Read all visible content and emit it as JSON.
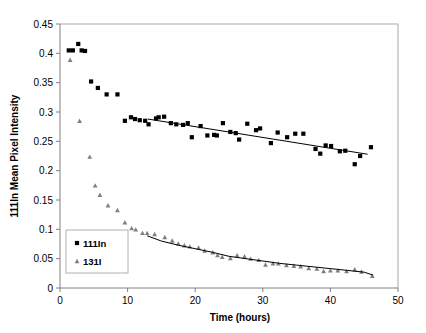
{
  "chart_data": {
    "type": "scatter",
    "title": "",
    "xlabel": "Time (hours)",
    "ylabel": "111In Mean Pixel Intensity",
    "xlim": [
      0,
      50
    ],
    "ylim": [
      0,
      0.45
    ],
    "xticks": [
      0,
      10,
      20,
      30,
      40,
      50
    ],
    "xtick_labels": [
      "0",
      "10",
      "20",
      "30",
      "40",
      "50"
    ],
    "yticks": [
      0,
      0.05,
      0.1,
      0.15,
      0.2,
      0.25,
      0.3,
      0.35,
      0.4,
      0.45
    ],
    "ytick_labels": [
      "0",
      "0.05",
      "0.1",
      "0.15",
      "0.2",
      "0.25",
      "0.3",
      "0.35",
      "0.4",
      "0.45"
    ],
    "grid": false,
    "legend_position": "lower-left-inside",
    "series": [
      {
        "name": "111In",
        "marker": "square",
        "color": "#000000",
        "points": [
          [
            1.3,
            0.405
          ],
          [
            1.9,
            0.405
          ],
          [
            2.7,
            0.416
          ],
          [
            3.2,
            0.405
          ],
          [
            3.7,
            0.404
          ],
          [
            4.6,
            0.352
          ],
          [
            5.6,
            0.341
          ],
          [
            6.9,
            0.33
          ],
          [
            8.5,
            0.33
          ],
          [
            9.6,
            0.285
          ],
          [
            10.5,
            0.291
          ],
          [
            11.1,
            0.288
          ],
          [
            11.8,
            0.286
          ],
          [
            12.6,
            0.285
          ],
          [
            13.1,
            0.279
          ],
          [
            14.2,
            0.289
          ],
          [
            14.6,
            0.291
          ],
          [
            15.4,
            0.292
          ],
          [
            16.4,
            0.281
          ],
          [
            17.2,
            0.279
          ],
          [
            18.2,
            0.278
          ],
          [
            18.9,
            0.281
          ],
          [
            19.5,
            0.257
          ],
          [
            20.8,
            0.276
          ],
          [
            21.8,
            0.26
          ],
          [
            22.8,
            0.261
          ],
          [
            23.2,
            0.26
          ],
          [
            24.1,
            0.281
          ],
          [
            25.2,
            0.266
          ],
          [
            26.0,
            0.264
          ],
          [
            26.5,
            0.253
          ],
          [
            27.7,
            0.28
          ],
          [
            29.0,
            0.269
          ],
          [
            29.6,
            0.272
          ],
          [
            31.2,
            0.247
          ],
          [
            32.2,
            0.265
          ],
          [
            33.6,
            0.257
          ],
          [
            34.8,
            0.263
          ],
          [
            36.0,
            0.263
          ],
          [
            37.8,
            0.237
          ],
          [
            38.5,
            0.229
          ],
          [
            39.3,
            0.243
          ],
          [
            40.1,
            0.242
          ],
          [
            41.4,
            0.233
          ],
          [
            42.2,
            0.234
          ],
          [
            43.6,
            0.211
          ],
          [
            44.4,
            0.225
          ],
          [
            46.0,
            0.24
          ]
        ],
        "trend_line": {
          "x0": 13.0,
          "y0": 0.288,
          "x1": 45.5,
          "y1": 0.228
        }
      },
      {
        "name": "131I",
        "marker": "triangle",
        "color": "#808080",
        "points": [
          [
            1.5,
            0.389
          ],
          [
            2.9,
            0.285
          ],
          [
            4.4,
            0.224
          ],
          [
            5.2,
            0.175
          ],
          [
            5.9,
            0.159
          ],
          [
            7.1,
            0.141
          ],
          [
            8.5,
            0.133
          ],
          [
            9.6,
            0.112
          ],
          [
            10.6,
            0.102
          ],
          [
            11.2,
            0.1
          ],
          [
            12.2,
            0.094
          ],
          [
            12.9,
            0.094
          ],
          [
            14.0,
            0.092
          ],
          [
            15.5,
            0.087
          ],
          [
            16.6,
            0.081
          ],
          [
            17.5,
            0.076
          ],
          [
            18.4,
            0.073
          ],
          [
            19.2,
            0.071
          ],
          [
            20.5,
            0.069
          ],
          [
            21.4,
            0.064
          ],
          [
            22.6,
            0.061
          ],
          [
            23.3,
            0.056
          ],
          [
            24.0,
            0.053
          ],
          [
            25.2,
            0.051
          ],
          [
            26.2,
            0.056
          ],
          [
            27.3,
            0.054
          ],
          [
            28.2,
            0.05
          ],
          [
            29.4,
            0.048
          ],
          [
            30.4,
            0.04
          ],
          [
            31.5,
            0.042
          ],
          [
            32.3,
            0.042
          ],
          [
            33.5,
            0.039
          ],
          [
            34.6,
            0.038
          ],
          [
            35.6,
            0.037
          ],
          [
            36.8,
            0.034
          ],
          [
            38.0,
            0.033
          ],
          [
            39.0,
            0.029
          ],
          [
            40.0,
            0.03
          ],
          [
            41.1,
            0.03
          ],
          [
            42.4,
            0.029
          ],
          [
            43.6,
            0.032
          ],
          [
            44.6,
            0.028
          ],
          [
            46.2,
            0.021
          ]
        ],
        "trend_line_points": [
          [
            12.9,
            0.089
          ],
          [
            15.0,
            0.08
          ],
          [
            17.5,
            0.073
          ],
          [
            20.0,
            0.067
          ],
          [
            22.5,
            0.061
          ],
          [
            25.0,
            0.054
          ],
          [
            27.5,
            0.05
          ],
          [
            30.0,
            0.046
          ],
          [
            32.5,
            0.042
          ],
          [
            35.0,
            0.039
          ],
          [
            37.5,
            0.036
          ],
          [
            40.0,
            0.033
          ],
          [
            42.5,
            0.03
          ],
          [
            45.0,
            0.027
          ],
          [
            46.3,
            0.022
          ]
        ]
      }
    ],
    "legend": [
      {
        "label": "111In",
        "marker": "square",
        "color": "#000000"
      },
      {
        "label": "131I",
        "marker": "triangle",
        "color": "#808080"
      }
    ]
  }
}
